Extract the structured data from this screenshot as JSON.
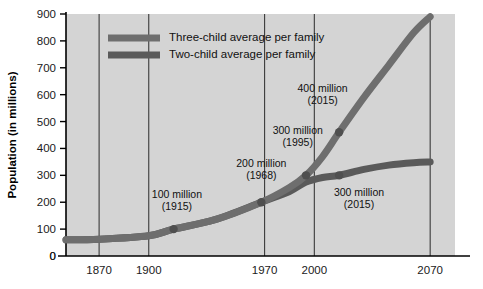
{
  "chart_data": {
    "type": "line",
    "title": "",
    "xlabel": "",
    "ylabel": "Population (in millions)",
    "xlim": [
      1850,
      2085
    ],
    "ylim": [
      0,
      900
    ],
    "grid": "vertical-only",
    "legend_position": "top-left-inside",
    "x_ticks": [
      "1870",
      "1900",
      "1970",
      "2000",
      "2070"
    ],
    "x_tick_values": [
      1870,
      1900,
      1970,
      2000,
      2070
    ],
    "y_ticks": [
      "0",
      "100",
      "200",
      "300",
      "400",
      "500",
      "600",
      "700",
      "800",
      "900"
    ],
    "y_tick_values": [
      0,
      100,
      200,
      300,
      400,
      500,
      600,
      700,
      800,
      900
    ],
    "origin_label": "0",
    "series": [
      {
        "name": "Three-child average per family",
        "color": "#6e6e6e",
        "x": [
          1850,
          1870,
          1900,
          1915,
          1940,
          1968,
          1985,
          1995,
          2005,
          2015,
          2030,
          2045,
          2060,
          2070
        ],
        "values": [
          60,
          62,
          75,
          100,
          135,
          200,
          255,
          300,
          370,
          460,
          590,
          710,
          830,
          890
        ]
      },
      {
        "name": "Two-child average per family",
        "color": "#5a5a5a",
        "x": [
          1850,
          1870,
          1900,
          1915,
          1940,
          1968,
          1985,
          1995,
          2005,
          2015,
          2030,
          2045,
          2060,
          2070
        ],
        "values": [
          60,
          62,
          75,
          100,
          135,
          200,
          240,
          275,
          292,
          300,
          322,
          338,
          347,
          350
        ]
      }
    ],
    "annotations": [
      {
        "label": "100 million",
        "year_label": "(1915)",
        "x": 1915,
        "y": 100,
        "text_x": 1917,
        "text_y": 215,
        "marker": true
      },
      {
        "label": "200 million",
        "year_label": "(1968)",
        "x": 1968,
        "y": 200,
        "text_x": 1968,
        "text_y": 330,
        "marker": true
      },
      {
        "label": "300 million",
        "year_label": "(1995)",
        "x": 1995,
        "y": 300,
        "text_x": 1990,
        "text_y": 455,
        "marker": true
      },
      {
        "label": "400 million",
        "year_label": "(2015)",
        "x": 2015,
        "y": 460,
        "text_x": 2005,
        "text_y": 610,
        "marker": true
      },
      {
        "label": "300 million",
        "year_label": "(2015)",
        "x": 2015,
        "y": 300,
        "text_x": 2027,
        "text_y": 222,
        "marker": true
      }
    ]
  },
  "colors": {
    "plot_background": "#d4d4d4",
    "page_background": "#ffffff",
    "gridline": "#2b2b2b",
    "axis": "#000000",
    "three_child": "#6e6e6e",
    "two_child": "#5a5a5a",
    "marker": "#4f4f4f",
    "text": "#111111"
  }
}
